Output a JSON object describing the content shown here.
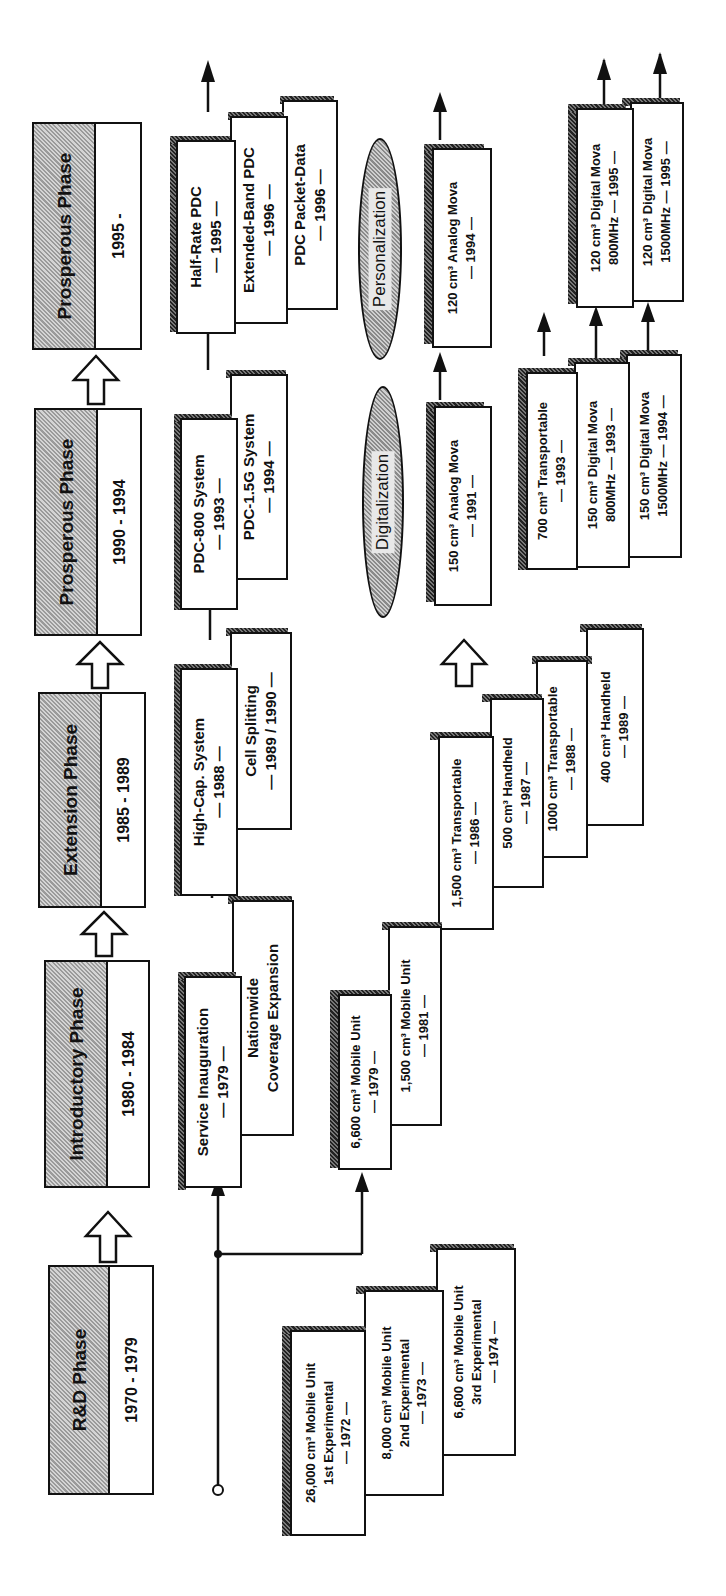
{
  "phases": [
    {
      "title": "R&D Phase",
      "years": "1970 - 1979"
    },
    {
      "title": "Introductory Phase",
      "years": "1980 - 1984"
    },
    {
      "title": "Extension Phase",
      "years": "1985 - 1989"
    },
    {
      "title": "Prosperous Phase",
      "years": "1990 - 1994"
    },
    {
      "title": "Prosperous Phase",
      "years": "1995 -"
    }
  ],
  "system_track": [
    {
      "lines": [
        "Service Inauguration",
        "— 1979 —"
      ]
    },
    {
      "lines": [
        "Nationwide",
        "Coverage Expansion"
      ]
    },
    {
      "lines": [
        "High-Cap. System",
        "— 1988 —"
      ]
    },
    {
      "lines": [
        "Cell Splitting",
        "— 1989 / 1990 —"
      ]
    },
    {
      "lines": [
        "PDC-800 System",
        "— 1993 —"
      ]
    },
    {
      "lines": [
        "PDC-1.5G System",
        "— 1994 —"
      ]
    },
    {
      "lines": [
        "Half-Rate PDC",
        "— 1995 —"
      ]
    },
    {
      "lines": [
        "Extended-Band PDC",
        "— 1996 —"
      ]
    },
    {
      "lines": [
        "PDC Packet-Data",
        "— 1996 —"
      ]
    }
  ],
  "experimental_units": [
    {
      "lines": [
        "26,000 cm³ Mobile Unit",
        "1st Experimental",
        "— 1972 —"
      ]
    },
    {
      "lines": [
        "8,000 cm³ Mobile Unit",
        "2nd Experimental",
        "— 1973 —"
      ]
    },
    {
      "lines": [
        "6,600 cm³ Mobile Unit",
        "3rd Experimental",
        "— 1974 —"
      ]
    }
  ],
  "terminal_track": [
    {
      "lines": [
        "6,600 cm³ Mobile Unit",
        "— 1979 —"
      ]
    },
    {
      "lines": [
        "1,500 cm³ Mobile Unit",
        "— 1981 —"
      ]
    },
    {
      "lines": [
        "1,500 cm³ Transportable",
        "— 1986 —"
      ]
    },
    {
      "lines": [
        "500 cm³ Handheld",
        "— 1987 —"
      ]
    },
    {
      "lines": [
        "1000 cm³ Transportable",
        "— 1988 —"
      ]
    },
    {
      "lines": [
        "400 cm³ Handheld",
        "— 1989 —"
      ]
    }
  ],
  "analog_mova": [
    {
      "lines": [
        "150 cm³ Analog Mova",
        "— 1991 —"
      ]
    },
    {
      "lines": [
        "120 cm³ Analog Mova",
        "— 1994 —"
      ]
    }
  ],
  "digital_mova": [
    {
      "lines": [
        "700 cm³ Transportable",
        "— 1993 —"
      ]
    },
    {
      "lines": [
        "150 cm³ Digital Mova",
        "800MHz — 1993 —"
      ]
    },
    {
      "lines": [
        "150 cm³ Digital Mova",
        "1500MHz — 1994 —"
      ]
    },
    {
      "lines": [
        "120 cm³ Digital Mova",
        "800MHz — 1995 —"
      ]
    },
    {
      "lines": [
        "120 cm³ Digital Mova",
        "1500MHz — 1995 —"
      ]
    }
  ],
  "trends": [
    "Digitalization",
    "Personalization"
  ]
}
